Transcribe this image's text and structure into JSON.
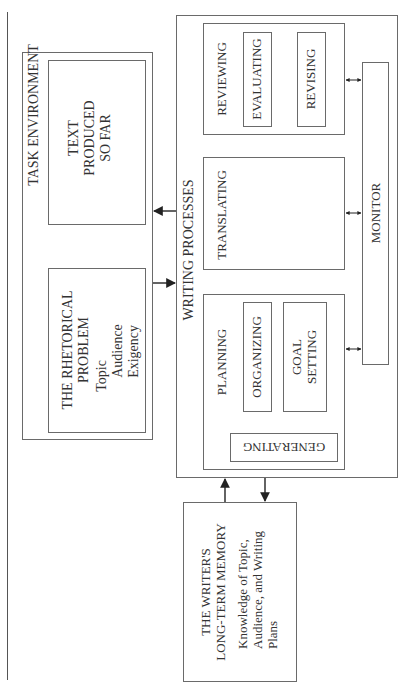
{
  "diagram": {
    "orientation": "rotated 90 degrees clockwise",
    "task_environment": {
      "label": "TASK ENVIRONMENT",
      "rhetorical_problem": {
        "title_line1": "THE RHETORICAL",
        "title_line2": "PROBLEM",
        "items": [
          "Topic",
          "Audience",
          "Exigency"
        ]
      },
      "text_so_far": {
        "line1": "TEXT",
        "line2": "PRODUCED",
        "line3": "SO FAR"
      }
    },
    "writing_processes": {
      "label": "WRITING PROCESSES",
      "planning": {
        "label": "PLANNING",
        "generating": "GENERATING",
        "organizing": "ORGANIZING",
        "goal_setting_line1": "GOAL",
        "goal_setting_line2": "SETTING"
      },
      "translating": {
        "label": "TRANSLATING"
      },
      "reviewing": {
        "label": "REVIEWING",
        "evaluating": "EVALUATING",
        "revising": "REVISING"
      },
      "monitor": {
        "label": "MONITOR"
      }
    },
    "long_term_memory": {
      "title_line1": "THE WRITER'S",
      "title_line2": "LONG-TERM MEMORY",
      "desc_line1": "Knowledge of Topic,",
      "desc_line2": "Audience, and Writing",
      "desc_line3": "Plans"
    },
    "colors": {
      "border": "#6a6a6a",
      "text": "#333333",
      "arrow": "#222222",
      "background": "#ffffff"
    }
  }
}
